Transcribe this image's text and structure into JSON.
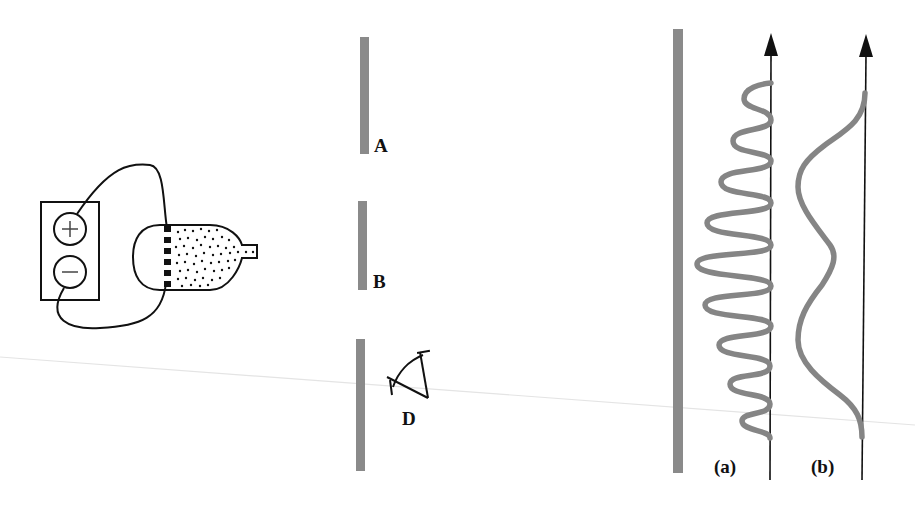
{
  "figure": {
    "colors": {
      "ink": "#111111",
      "barrier": "#8a8a8a",
      "curve": "#858585",
      "scan_line": "#e2e2e2"
    }
  },
  "source": {
    "battery": {
      "plus_symbol": "+",
      "minus_symbol": "−"
    },
    "electron_gun": {
      "filament_segments": 6
    }
  },
  "slits": {
    "labels": {
      "A": "A",
      "B": "B"
    },
    "detector_label": "D"
  },
  "screen": {
    "patterns": [
      {
        "id": "a",
        "label": "(a)",
        "kind": "interference-pattern"
      },
      {
        "id": "b",
        "label": "(b)",
        "kind": "two-hump-pattern"
      }
    ]
  }
}
